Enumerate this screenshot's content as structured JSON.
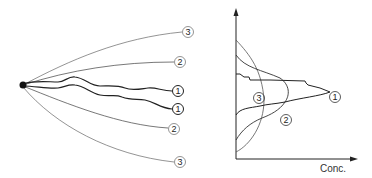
{
  "diagram": {
    "left_panel": {
      "description": "Plume trajectories from a point source",
      "source": {
        "x": 23,
        "y": 85
      },
      "paths": [
        {
          "label": "3",
          "end": {
            "x": 182,
            "y": 32
          },
          "style": "thin-smooth"
        },
        {
          "label": "2",
          "end": {
            "x": 174,
            "y": 62
          },
          "style": "thin-smooth"
        },
        {
          "label": "1",
          "end": {
            "x": 172,
            "y": 91
          },
          "style": "thick-wavy"
        },
        {
          "label": "1",
          "end": {
            "x": 172,
            "y": 109
          },
          "style": "thick-wavy"
        },
        {
          "label": "2",
          "end": {
            "x": 168,
            "y": 129
          },
          "style": "thin-smooth"
        },
        {
          "label": "3",
          "end": {
            "x": 174,
            "y": 162
          },
          "style": "thin-smooth"
        }
      ],
      "labels": [
        "3",
        "2",
        "1",
        "1",
        "2",
        "3"
      ]
    },
    "right_panel": {
      "description": "Concentration profiles",
      "x_axis_label": "Conc.",
      "curves": [
        {
          "label": "1",
          "shape": "narrow peaked spike"
        },
        {
          "label": "2",
          "shape": "medium bell"
        },
        {
          "label": "3",
          "shape": "wide flat bell"
        }
      ]
    },
    "colors": {
      "line": "#222222",
      "thin_line": "#555555",
      "background": "#ffffff"
    }
  }
}
